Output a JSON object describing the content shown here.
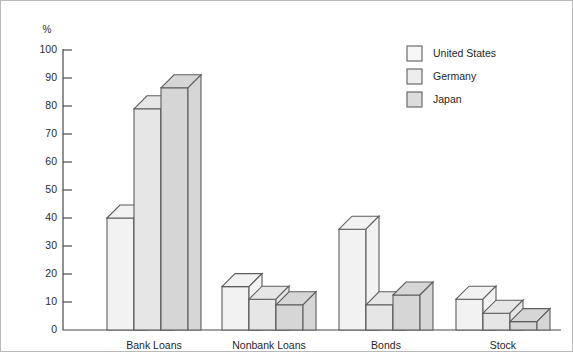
{
  "chart_data": {
    "type": "bar",
    "title": "",
    "subtitle": "",
    "xlabel": "",
    "ylabel": "%",
    "ylim": [
      0,
      100
    ],
    "yticks": [
      0,
      10,
      20,
      30,
      40,
      50,
      60,
      70,
      80,
      90,
      100
    ],
    "ytick_labels": [
      "0",
      "10",
      "20",
      "30",
      "40",
      "50",
      "60",
      "70",
      "80",
      "90",
      "100"
    ],
    "grid": false,
    "legend_position": "top-right",
    "categories": [
      "Bank Loans",
      "Nonbank Loans",
      "Bonds",
      "Stock"
    ],
    "series": [
      {
        "name": "United States",
        "color": "#f2f2f2",
        "values": [
          40,
          15.5,
          36,
          11
        ]
      },
      {
        "name": "Germany",
        "color": "#e6e6e6",
        "values": [
          79,
          11,
          9,
          6
        ]
      },
      {
        "name": "Japan",
        "color": "#d6d6d6",
        "values": [
          86.5,
          9,
          12.5,
          3
        ]
      }
    ],
    "annotations": []
  },
  "legend": {
    "items": [
      {
        "label": "United States",
        "swatch": "#f7f7f7"
      },
      {
        "label": "Germany",
        "swatch": "#ededed"
      },
      {
        "label": "Japan",
        "swatch": "#dcdcdc"
      }
    ]
  },
  "axis": {
    "unit": "%",
    "tick_labels": [
      "100",
      "90",
      "80",
      "70",
      "60",
      "50",
      "40",
      "30",
      "20",
      "10",
      "0"
    ]
  },
  "colors": {
    "axis": "#4a4a4a",
    "bar_stroke": "#5d5d5d",
    "frame": "#b9b9b9",
    "text": "#1f1f1f",
    "background": "#ffffff"
  }
}
